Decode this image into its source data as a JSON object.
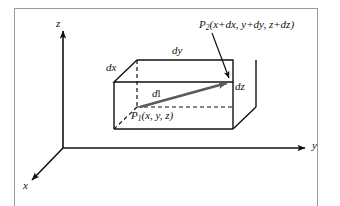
{
  "figure": {
    "background_color": "#ffffff",
    "line_color": "#111111",
    "frame_color": "#9a9a9a",
    "vector_color": "#555555"
  },
  "axes": {
    "z_label": "z",
    "y_label": "y",
    "x_label": "x"
  },
  "box": {
    "edge_labels": {
      "dx": "dx",
      "dy": "dy",
      "dz": "dz"
    }
  },
  "vector": {
    "label_d": "d",
    "label_l": "l"
  },
  "points": {
    "p1": {
      "name": "P",
      "subscript": "1",
      "coords": "(x, y, z)"
    },
    "p2": {
      "name": "P",
      "subscript": "2",
      "coords": "(x+dx, y+dy, z+dz)"
    }
  }
}
